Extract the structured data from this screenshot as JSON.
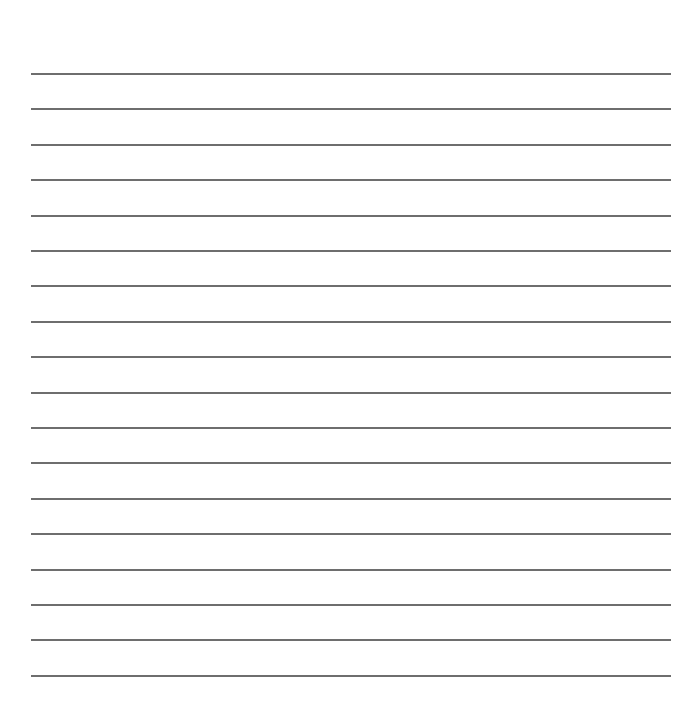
{
  "document": {
    "type": "lined-paper",
    "line_count": 18,
    "line_color": "#6e6e6e",
    "background": "#ffffff",
    "first_line_y": 73,
    "line_spacing": 35.4,
    "line_left": 31,
    "line_width": 640
  }
}
